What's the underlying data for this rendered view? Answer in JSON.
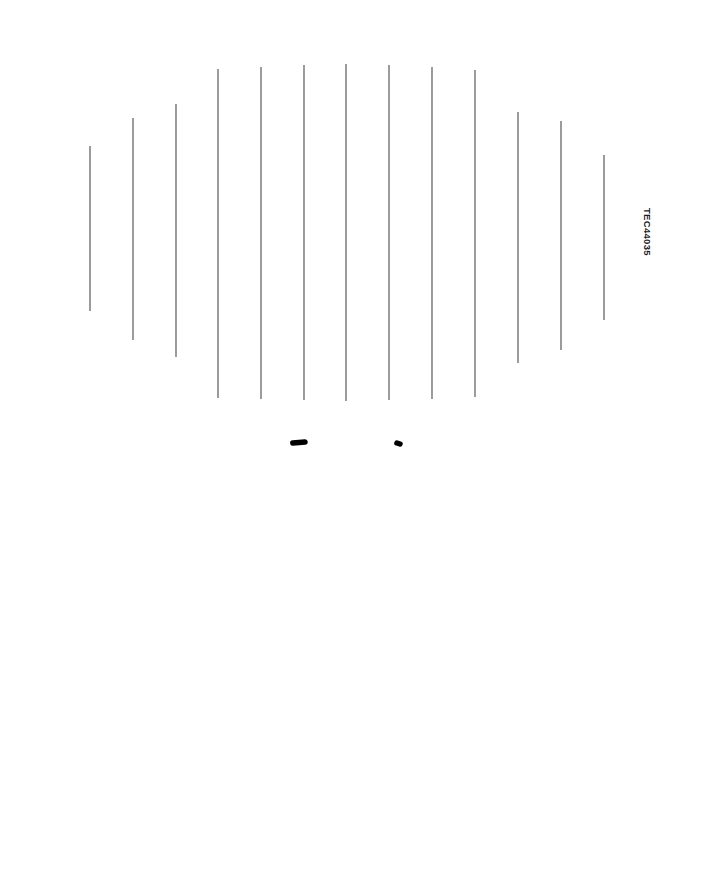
{
  "page": {
    "width": 703,
    "height": 879,
    "background_color": "#ffffff",
    "clipped_top_text": "",
    "part_code": "TEC44035"
  },
  "figure": {
    "name": "hourglass-double-ellipse-pattern",
    "outline_color": "#000000",
    "outline_width": 5.5,
    "hatch_color": "#4a4a4a",
    "hatch_width": 1.1,
    "upper_ellipse": {
      "cx": 351,
      "cy": 236,
      "rx": 333,
      "ry": 209
    },
    "lower_ellipse": {
      "cx": 348,
      "cy": 653,
      "rx": 330,
      "ry": 213
    },
    "cusp": {
      "y": 443,
      "left_tip_x": 305,
      "right_tip_x": 400
    },
    "hatch_lines": [
      {
        "x": 90,
        "y_top": 146,
        "y_bottom": 311
      },
      {
        "x": 133,
        "y_top": 118,
        "y_bottom": 340
      },
      {
        "x": 176,
        "y_top": 104,
        "y_bottom": 357
      },
      {
        "x": 218,
        "y_top": 69,
        "y_bottom": 398
      },
      {
        "x": 261,
        "y_top": 67,
        "y_bottom": 399
      },
      {
        "x": 304,
        "y_top": 65,
        "y_bottom": 400
      },
      {
        "x": 346,
        "y_top": 64,
        "y_bottom": 401
      },
      {
        "x": 389,
        "y_top": 65,
        "y_bottom": 400
      },
      {
        "x": 432,
        "y_top": 67,
        "y_bottom": 399
      },
      {
        "x": 475,
        "y_top": 70,
        "y_bottom": 397
      },
      {
        "x": 518,
        "y_top": 112,
        "y_bottom": 363
      },
      {
        "x": 561,
        "y_top": 121,
        "y_bottom": 350
      },
      {
        "x": 604,
        "y_top": 155,
        "y_bottom": 320
      }
    ]
  }
}
